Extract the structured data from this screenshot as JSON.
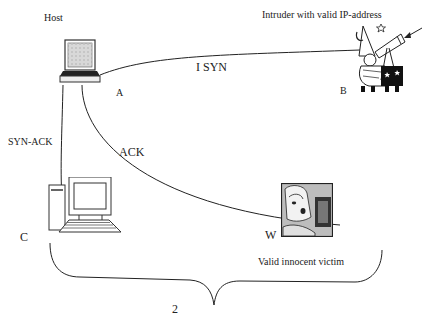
{
  "diagram": {
    "type": "network-attack-diagram",
    "nodes": [
      {
        "id": "A",
        "label": "A",
        "caption": "Host",
        "icon": "laptop-icon"
      },
      {
        "id": "B",
        "label": "B",
        "caption": "Intruder  with valid IP-address",
        "icon": "wizard-telescope-icon"
      },
      {
        "id": "C",
        "label": "C",
        "caption": "",
        "icon": "desktop-computer-icon"
      },
      {
        "id": "W",
        "label": "W",
        "caption": "Valid innocent victim",
        "icon": "victim-woman-icon"
      }
    ],
    "edges": [
      {
        "from": "B",
        "to": "A",
        "label": "I   SYN",
        "step": "I"
      },
      {
        "from": "A",
        "to": "C",
        "label": "SYN-ACK"
      },
      {
        "from": "A",
        "to": "W",
        "label": "ACK"
      }
    ],
    "brace": {
      "spans": [
        "C",
        "W"
      ],
      "label": "2"
    },
    "arrow": {
      "points_to": "B",
      "icon": "arrow-icon"
    }
  },
  "labels": {
    "host": "Host",
    "intruder": "Intruder  with valid IP-address",
    "node_a": "A",
    "node_b": "B",
    "node_c": "C",
    "node_w": "W",
    "syn": "I    SYN",
    "syn_ack": "SYN-ACK",
    "ack": "ACK",
    "victim": "Valid innocent victim",
    "brace_label": "2"
  },
  "colors": {
    "line": "#222222",
    "background": "#ffffff"
  }
}
